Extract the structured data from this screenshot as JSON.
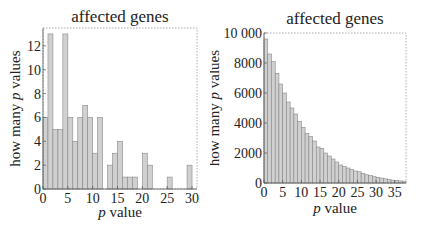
{
  "chart_data": [
    {
      "type": "bar",
      "title": "affected genes",
      "xlabel": "p value",
      "ylabel": "how many p values",
      "xlim": [
        0,
        31
      ],
      "ylim": [
        0,
        13.5
      ],
      "xticks": [
        0,
        5,
        10,
        15,
        20,
        25,
        30
      ],
      "yticks": [
        0,
        2,
        4,
        6,
        8,
        10,
        12
      ],
      "bin_width": 1,
      "bin_starts": [
        0,
        1,
        2,
        3,
        4,
        5,
        6,
        7,
        8,
        9,
        10,
        11,
        12,
        13,
        14,
        15,
        16,
        17,
        18,
        19,
        20,
        21,
        22,
        23,
        24,
        25,
        26,
        27,
        28,
        29
      ],
      "values": [
        6,
        13,
        5,
        5,
        13,
        6,
        4,
        6,
        7,
        6,
        3,
        6,
        0,
        2,
        3,
        4,
        1,
        1,
        1,
        0,
        3,
        2,
        0,
        0,
        0,
        1,
        0,
        0,
        0,
        2
      ],
      "grid": false,
      "bar_color": "#d0d0d0"
    },
    {
      "type": "bar",
      "title": "affected genes",
      "xlabel": "p value",
      "ylabel": "how many p values",
      "xlim": [
        0,
        38
      ],
      "ylim": [
        0,
        10000
      ],
      "xticks": [
        0,
        5,
        10,
        15,
        20,
        25,
        30,
        35
      ],
      "yticks": [
        0,
        2000,
        4000,
        6000,
        8000,
        10000
      ],
      "ytick_labels": [
        "0",
        "2000",
        "4000",
        "6000",
        "8000",
        "10 000"
      ],
      "bin_width": 1,
      "values": [
        9600,
        8600,
        8100,
        7300,
        6600,
        6000,
        5400,
        5000,
        4600,
        4100,
        3700,
        3300,
        3100,
        2800,
        2400,
        2300,
        2000,
        1800,
        1600,
        1400,
        1200,
        1100,
        1000,
        900,
        800,
        750,
        650,
        550,
        500,
        420,
        380,
        330,
        280,
        230,
        190,
        160,
        140,
        120
      ],
      "grid": false,
      "bar_color": "#d0d0d0"
    }
  ]
}
